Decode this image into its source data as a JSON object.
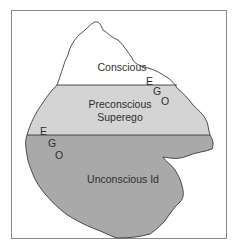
{
  "diagram": {
    "type": "iceberg-model",
    "colors": {
      "frame_border": "#8a8a8a",
      "conscious_fill": "#ffffff",
      "preconscious_fill": "#d4d4d4",
      "unconscious_fill": "#a9a9a9",
      "outline": "#3a3a3a",
      "text": "#2e2e2e"
    },
    "regions": [
      {
        "id": "conscious",
        "label": "Conscious"
      },
      {
        "id": "preconscious",
        "label_line1": "Preconscious",
        "label_line2": "Superego"
      },
      {
        "id": "unconscious",
        "label": "Unconscious Id"
      }
    ],
    "ego_right": [
      "E",
      "G",
      "O"
    ],
    "ego_left": [
      "E",
      "G",
      "O"
    ]
  }
}
